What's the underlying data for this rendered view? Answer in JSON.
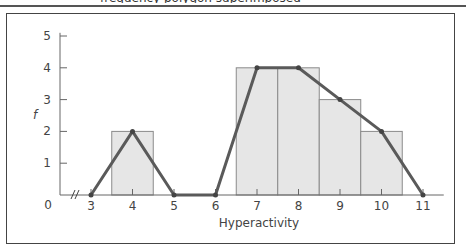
{
  "caption": "frequency polygon superimposed",
  "chart_data": {
    "type": "bar",
    "overlay": "line",
    "title": "",
    "xlabel": "Hyperactivity",
    "ylabel": "f",
    "categories": [
      3,
      4,
      5,
      6,
      7,
      8,
      9,
      10,
      11
    ],
    "histogram": [
      {
        "x": 4,
        "f": 2
      },
      {
        "x": 7,
        "f": 4
      },
      {
        "x": 8,
        "f": 4
      },
      {
        "x": 9,
        "f": 3
      },
      {
        "x": 10,
        "f": 2
      }
    ],
    "series": [
      {
        "name": "frequency polygon",
        "x": [
          3,
          4,
          5,
          6,
          7,
          8,
          9,
          10,
          11
        ],
        "values": [
          0,
          2,
          0,
          0,
          4,
          4,
          3,
          2,
          0
        ]
      }
    ],
    "ylim": [
      0,
      5
    ],
    "yticks": [
      0,
      1,
      2,
      3,
      4,
      5
    ],
    "xticks": [
      3,
      4,
      5,
      6,
      7,
      8,
      9,
      10,
      11
    ],
    "axis_break": "//",
    "grid": false,
    "colors": {
      "bar_fill": "#e6e6e6",
      "bar_stroke": "#8a8a8a",
      "line": "#5a5a5a",
      "axis": "#666666"
    }
  }
}
